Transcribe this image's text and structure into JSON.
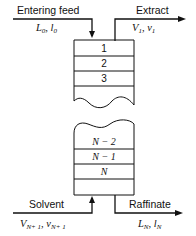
{
  "diagram": {
    "streams": {
      "feed": {
        "label": "Entering feed",
        "symbol": "L0, l0",
        "sym_main_1": "L",
        "sub_1": "0",
        "sym_main_2": "l",
        "sub_2": "0"
      },
      "extract": {
        "label": "Extract",
        "sym_main_1": "V",
        "sub_1": "1",
        "sym_main_2": "v",
        "sub_2": "1"
      },
      "solvent": {
        "label": "Solvent",
        "sym_main_1": "V",
        "sub_1": "N+ 1",
        "sym_main_2": "v",
        "sub_2": "N+ 1"
      },
      "raffinate": {
        "label": "Raffinate",
        "sym_main_1": "L",
        "sub_1": "N",
        "sym_main_2": "l",
        "sub_2": "N"
      }
    },
    "stages_top": [
      "1",
      "2",
      "3"
    ],
    "stages_bottom": [
      "N − 2",
      "N − 1",
      "N"
    ]
  }
}
